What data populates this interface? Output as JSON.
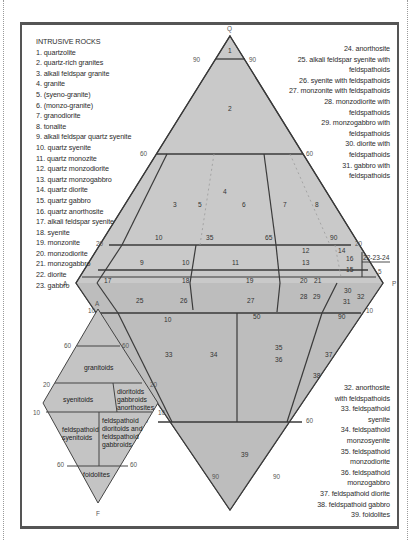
{
  "legend": {
    "title": "INTRUSIVE ROCKS",
    "items_left": [
      "1. quartzolite",
      "2. quartz-rich granites",
      "3. alkali feldspar granite",
      "4. granite",
      "5. (syeno-granite)",
      "6. (monzo-granite)",
      "7. granodiorite",
      "8. tonalite",
      "9. alkali feldspar quartz syenite",
      "10. quartz syenite",
      "11. quartz monozite",
      "12. quartz monzodiorite",
      "13. quartz monzogabbro",
      "14. quartz diorite",
      "15. quartz gabbro",
      "16. quartz anorthosite",
      "17. alkali feldspar syenite",
      "18. syenite",
      "19. monzonite",
      "20. monzodiorite",
      "21. monzogabbro",
      "22. diorite",
      "23. gabbro"
    ],
    "items_right_top": [
      "24. anorthosite",
      "25. alkali feldspar syenite with",
      "feldspathoids",
      "26. syenite with feldspathoids",
      "27. monzonite with feldspathoids",
      "28. monzodiorite with",
      "feldspathoids",
      "29. monzogabbro with",
      "feldspathoids",
      "30. diorite with",
      "feldspathoids",
      "31. gabbro with",
      "feldspathoids"
    ],
    "items_right_bottom": [
      "32. anorthosite",
      "with feldspathoids",
      "33. feldspathoid",
      "syenite",
      "34. feldspathoid",
      "monzosyenite",
      "35. feldspathoid",
      "monzodiorite",
      "36. feldspathoid",
      "monzogabbro",
      "37. feldspathoid diorite",
      "38. feldspathoid gabbro",
      "39. foidolites"
    ]
  },
  "main_diagram": {
    "vertices": {
      "top": "Q",
      "left": "A",
      "right": "P",
      "bottom": "F"
    },
    "fill_color": "#c9c9c9",
    "line_color": "#3a3a3a",
    "ticks": {
      "q90_left": "90",
      "q90_right": "90",
      "q60_left": "60",
      "q60_right": "60",
      "q20_left": "20",
      "q20_right": "20",
      "f10_left": "10",
      "f10_right": "10",
      "f60_left": "60",
      "f60_right": "60",
      "f90_left": "90",
      "f90_right": "90",
      "p10": "10",
      "p35": "35",
      "p65": "65",
      "p90": "90",
      "p50": "50",
      "p10b": "10",
      "p90b": "90",
      "p5": "5",
      "label_22_23_24": "22-23-24"
    },
    "fields": {
      "f1": "1",
      "f2": "2",
      "f3": "3",
      "f4": "4",
      "f5": "5",
      "f6": "6",
      "f7": "7",
      "f8": "8",
      "f9": "9",
      "f10": "10",
      "f11": "11",
      "f12": "12",
      "f13": "13",
      "f14": "14",
      "f15": "15",
      "f16": "16",
      "f17": "17",
      "f18": "18",
      "f19": "19",
      "f20": "20",
      "f21": "21",
      "f25": "25",
      "f26": "26",
      "f27": "27",
      "f28": "28",
      "f29": "29",
      "f30": "30",
      "f31": "31",
      "f32": "32",
      "f33": "33",
      "f34": "34",
      "f35": "35",
      "f36": "36",
      "f37": "37",
      "f38": "38",
      "f39": "39"
    }
  },
  "small_diagram": {
    "vertices": {
      "top": "A",
      "bottom": "F"
    },
    "ticks": {
      "t60l": "60",
      "t60r": "60",
      "t20l": "20",
      "t20r": "20",
      "t10l": "10",
      "t10r": "10",
      "b60l": "60",
      "b60r": "60"
    },
    "fields": {
      "granitoids": "granitoids",
      "syenitoids": "syenitoids",
      "dgA": "dioritoids",
      "dgB": "gabbroids",
      "dgC": "anorthosites",
      "fsA": "feldspathoid",
      "fsB": "syenitoids",
      "fdA": "feldspathoid",
      "fdB": "dioritoids and",
      "fdC": "feldspathoid",
      "fdD": "gabbroids",
      "foidolites": "foidolites"
    }
  }
}
